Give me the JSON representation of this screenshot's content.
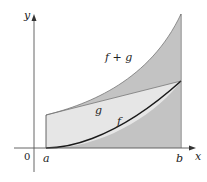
{
  "diagram": {
    "type": "function-sum-area",
    "axes": {
      "x_label": "x",
      "y_label": "y",
      "origin_label": "0"
    },
    "ticks": {
      "a_label": "a",
      "b_label": "b"
    },
    "curves": [
      {
        "name": "f+g",
        "label": "f + g"
      },
      {
        "name": "g",
        "label": "g"
      },
      {
        "name": "f",
        "label": "f"
      }
    ],
    "colors": {
      "axis": "#555555",
      "curve_f": "#1a1a1a",
      "shade_g": "#e6e6e6",
      "hatch": "#555555"
    }
  }
}
